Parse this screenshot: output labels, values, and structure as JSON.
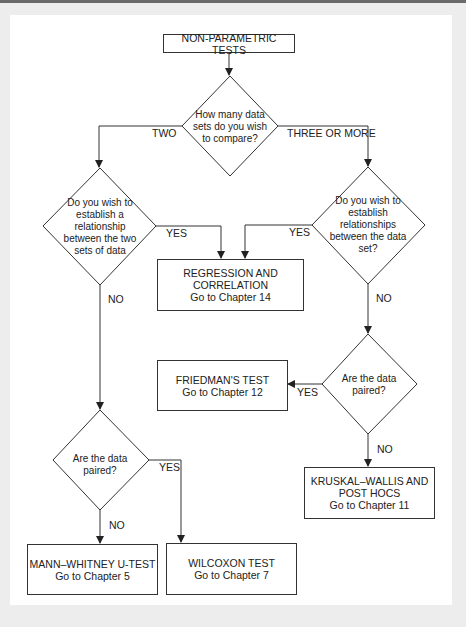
{
  "diagram": {
    "title": "NON-PARAMETRIC TESTS",
    "decisions": {
      "compare": [
        "How many data",
        "sets do you wish",
        "to compare?"
      ],
      "relationship_two": [
        "Do you wish to",
        "establish a",
        "relationship",
        "between the two",
        "sets of data"
      ],
      "relationship_three": [
        "Do you wish to",
        "establish",
        "relationships",
        "between the data",
        "set?"
      ],
      "paired_right": [
        "Are the data",
        "paired?"
      ],
      "paired_left": [
        "Are the data",
        "paired?"
      ]
    },
    "outcomes": {
      "regression": [
        "REGRESSION AND",
        "CORRELATION",
        "Go to Chapter 14"
      ],
      "friedman": [
        "FRIEDMAN'S TEST",
        "Go to Chapter 12"
      ],
      "kruskal": [
        "KRUSKAL–WALLIS AND",
        "POST HOCS",
        "Go to Chapter 11"
      ],
      "mann_whitney": [
        "MANN–WHITNEY U-TEST",
        "Go to Chapter 5"
      ],
      "wilcoxon": [
        "WILCOXON TEST",
        "Go to Chapter 7"
      ]
    },
    "edges": {
      "two": "TWO",
      "three_or_more": "THREE OR MORE",
      "yes_left_rel": "YES",
      "yes_right_rel": "YES",
      "no_left_rel": "NO",
      "no_right_rel": "NO",
      "yes_right_paired": "YES",
      "no_right_paired": "NO",
      "yes_left_paired": "YES",
      "no_left_paired": "NO"
    },
    "colors": {
      "line": "#333333",
      "background": "#ffffff",
      "frame": "#ededed"
    }
  }
}
